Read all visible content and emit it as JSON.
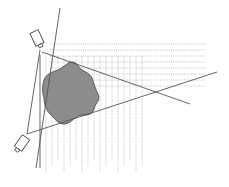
{
  "diagram": {
    "title": "",
    "colors": {
      "background": "#ffffff",
      "line": "#555555",
      "dotted": "#9a9a9a",
      "object_fill": "#8c8c8c",
      "object_stroke": "#444444",
      "sensor_stroke": "#444444"
    },
    "sensors": [
      {
        "name": "top-sensor",
        "cx": 37,
        "cy": 38,
        "w": 9,
        "h": 14,
        "rotate": -25
      },
      {
        "name": "bottom-sensor",
        "cx": 22,
        "cy": 143,
        "w": 9,
        "h": 14,
        "rotate": 35
      }
    ],
    "lines": [
      {
        "name": "long-diagonal-line",
        "x1": 60,
        "y1": 8,
        "x2": 36,
        "y2": 168
      },
      {
        "name": "sensor-connector-line",
        "x1": 40,
        "y1": 50,
        "x2": 27,
        "y2": 134
      },
      {
        "name": "vertical-axis-line",
        "x1": 40,
        "y1": 55,
        "x2": 40,
        "y2": 168
      },
      {
        "name": "top-sensor-ray",
        "x1": 42,
        "y1": 52,
        "x2": 190,
        "y2": 104
      },
      {
        "name": "bottom-sensor-ray",
        "x1": 27,
        "y1": 134,
        "x2": 217,
        "y2": 72
      }
    ],
    "horizontal_dotted": {
      "x1": 50,
      "x2": 205,
      "ys": [
        44,
        50,
        56,
        62,
        68,
        74,
        80,
        86
      ]
    },
    "vertical_dotted": {
      "y1": 56,
      "y2": 172,
      "xs": [
        46,
        52,
        58,
        64,
        70,
        76,
        82,
        88,
        94,
        100,
        106,
        112,
        118,
        124,
        130,
        136,
        142
      ]
    }
  }
}
